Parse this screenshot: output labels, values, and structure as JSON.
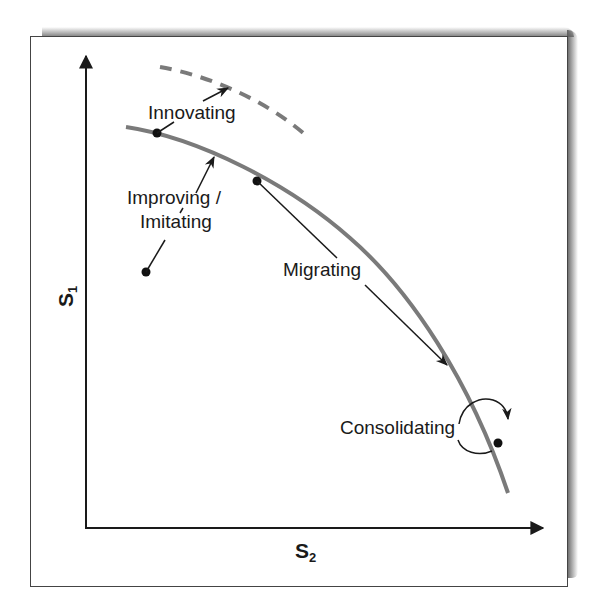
{
  "diagram": {
    "type": "strategy-frontier",
    "axes": {
      "y": {
        "label": "S",
        "subscript": "1"
      },
      "x": {
        "label": "S",
        "subscript": "2"
      }
    },
    "curves": [
      {
        "name": "current-frontier",
        "style": "solid",
        "color": "#7a7a7a"
      },
      {
        "name": "new-frontier",
        "style": "dashed",
        "color": "#7a7a7a"
      }
    ],
    "labels": {
      "innovating": "Innovating",
      "improving_line1": "Improving /",
      "improving_line2": "Imitating",
      "migrating": "Migrating",
      "consolidating": "Consolidating"
    },
    "colors": {
      "curve": "#7a7a7a",
      "axis": "#1a1a1a",
      "arrow": "#1a1a1a",
      "frame": "#444444"
    }
  }
}
